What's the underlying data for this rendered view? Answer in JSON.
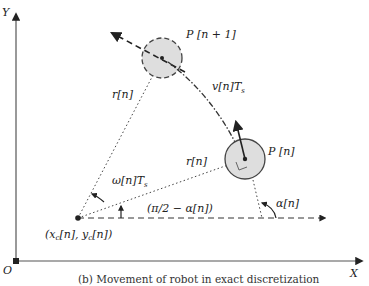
{
  "diagram": {
    "axes": {
      "x_label": "X",
      "y_label": "Y",
      "origin_label": "O"
    },
    "points": {
      "center_label": "(x",
      "center_sub_x": "c",
      "center_mid": "[n], y",
      "center_sub_y": "c",
      "center_end": "[n])",
      "current_label": "P [n]",
      "next_label": "P [n + 1]"
    },
    "labels": {
      "radius_top": "r[n]",
      "radius_right": "r[n]",
      "velocity": "v[n]T",
      "velocity_sub": "s",
      "angular": "ω[n]T",
      "angular_sub": "s",
      "angle_complement": "(π/2 − α[n])",
      "angle_alpha": "α[n]"
    },
    "caption": "(b) Movement of robot in exact discretization",
    "colors": {
      "line": "#333333",
      "robot_fill": "#dedede",
      "robot_stroke": "#444444"
    }
  }
}
